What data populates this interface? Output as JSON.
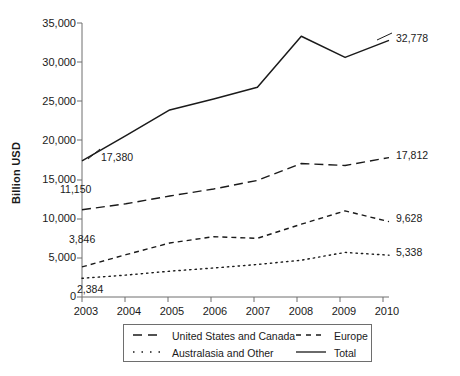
{
  "chart_data": {
    "type": "line",
    "title": "",
    "xlabel": "",
    "ylabel": "Billion USD",
    "categories": [
      "2003",
      "2004",
      "2005",
      "2006",
      "2007",
      "2008",
      "2009",
      "2010"
    ],
    "ylim": [
      0,
      35000
    ],
    "ytick_labels": [
      "35,000",
      "30,000",
      "25,000",
      "20,000",
      "15,000",
      "10,000",
      "5,000",
      "0"
    ],
    "ytick_values": [
      35000,
      30000,
      25000,
      20000,
      15000,
      10000,
      5000,
      0
    ],
    "grid": false,
    "legend_position": "bottom",
    "series": [
      {
        "name": "Total",
        "style": "solid",
        "color": "#1a1a1a",
        "values": [
          17380,
          20600,
          23900,
          25300,
          26800,
          33300,
          30600,
          32778
        ],
        "start_label": "17,380",
        "end_label": "32,778"
      },
      {
        "name": "United States and Canada",
        "style": "long-dash",
        "color": "#1a1a1a",
        "values": [
          11150,
          11900,
          12900,
          13800,
          14900,
          17050,
          16800,
          17812
        ],
        "start_label": "11,150",
        "end_label": "17,812"
      },
      {
        "name": "Europe",
        "style": "short-dash",
        "color": "#1a1a1a",
        "values": [
          3846,
          5400,
          6900,
          7700,
          7500,
          9300,
          11000,
          9628
        ],
        "start_label": "3,846",
        "end_label": "9,628"
      },
      {
        "name": "Australasia and Other",
        "style": "dotted",
        "color": "#1a1a1a",
        "values": [
          2384,
          2800,
          3300,
          3700,
          4150,
          4700,
          5700,
          5338
        ],
        "start_label": "2,384",
        "end_label": "5,338"
      }
    ]
  },
  "axis": {
    "y_title": "Billion USD",
    "y_ticks": [
      "35,000",
      "30,000",
      "25,000",
      "20,000",
      "15,000",
      "10,000",
      "5,000",
      "0"
    ],
    "x_ticks": [
      "2003",
      "2004",
      "2005",
      "2006",
      "2007",
      "2008",
      "2009",
      "2010"
    ]
  },
  "data_labels": {
    "total_start": "17,380",
    "total_end": "32,778",
    "usca_start": "11,150",
    "usca_end": "17,812",
    "europe_start": "3,846",
    "europe_end": "9,628",
    "australasia_start": "2,384",
    "australasia_end": "5,338"
  },
  "legend": {
    "items": [
      {
        "label": "United States and Canada",
        "style": "long-dash"
      },
      {
        "label": "Europe",
        "style": "short-dash"
      },
      {
        "label": "Australasia and Other",
        "style": "dotted"
      },
      {
        "label": "Total",
        "style": "solid"
      }
    ]
  },
  "colors": {
    "line": "#1a1a1a",
    "axis": "#6e6e6e",
    "text": "#1a1a1a",
    "background": "#ffffff"
  }
}
